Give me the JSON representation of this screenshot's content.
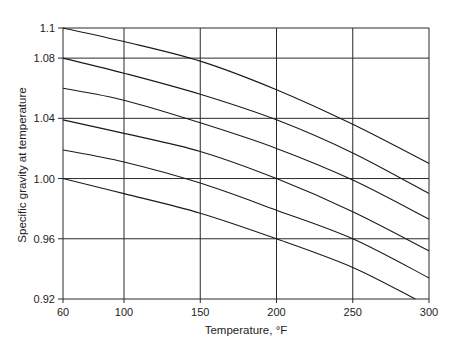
{
  "chart_data": {
    "type": "line",
    "title": "",
    "xlabel": "Temperature, °F",
    "ylabel": "Specific gravity at temperature",
    "xlim": [
      60,
      300
    ],
    "ylim": [
      0.92,
      1.1
    ],
    "grid": true,
    "legend": "none",
    "x_ticks": [
      60,
      100,
      150,
      200,
      250,
      300
    ],
    "x_tick_labels": [
      "60",
      "100",
      "150",
      "200",
      "250",
      "300"
    ],
    "y_ticks": [
      0.92,
      0.96,
      1.0,
      1.04,
      1.08,
      1.1
    ],
    "y_tick_labels": [
      "0.92",
      "0.96",
      "1.00",
      "1.04",
      "1.08",
      "1.1"
    ],
    "x": [
      60,
      100,
      150,
      200,
      250,
      300
    ],
    "series": [
      {
        "name": "SG 1.10 at 60°F",
        "values": [
          1.1,
          1.091,
          1.078,
          1.059,
          1.036,
          1.01
        ]
      },
      {
        "name": "SG 1.08 at 60°F",
        "values": [
          1.08,
          1.07,
          1.056,
          1.039,
          1.017,
          0.99
        ]
      },
      {
        "name": "SG 1.06 at 60°F",
        "values": [
          1.06,
          1.052,
          1.037,
          1.02,
          0.999,
          0.973
        ]
      },
      {
        "name": "SG 1.04 at 60°F",
        "values": [
          1.039,
          1.03,
          1.018,
          1.0,
          0.978,
          0.952
        ]
      },
      {
        "name": "SG 1.02 at 60°F",
        "values": [
          1.019,
          1.011,
          0.997,
          0.979,
          0.96,
          0.934
        ]
      },
      {
        "name": "SG 1.00 at 60°F",
        "values": [
          1.0,
          0.99,
          0.977,
          0.96,
          0.941,
          0.92
        ]
      }
    ],
    "series_end_x_note": "lowest curve reaches 0.92 at about 291°F",
    "line_color": "#1a1a1a",
    "grid_color": "#2a2a2a"
  }
}
